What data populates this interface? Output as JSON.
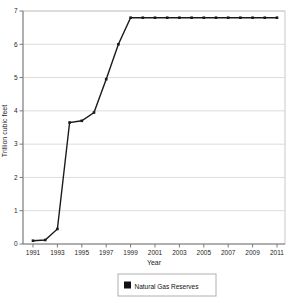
{
  "figure": {
    "background": "#ffffff"
  },
  "chart_data": {
    "type": "line",
    "title": "",
    "xlabel": "Year",
    "ylabel": "Trillion cubic feet",
    "x": [
      1991,
      1992,
      1993,
      1994,
      1995,
      1996,
      1997,
      1998,
      1999,
      2000,
      2001,
      2002,
      2003,
      2004,
      2005,
      2006,
      2007,
      2008,
      2009,
      2010,
      2011
    ],
    "series": [
      {
        "name": "Natural Gas Reserves",
        "values": [
          0.1,
          0.12,
          0.45,
          3.65,
          3.7,
          3.95,
          4.95,
          6.0,
          6.8,
          6.8,
          6.8,
          6.8,
          6.8,
          6.8,
          6.8,
          6.8,
          6.8,
          6.8,
          6.8,
          6.8,
          6.8
        ],
        "color": "#1a1a1a",
        "marker": "square"
      }
    ],
    "ylim": [
      0,
      7
    ],
    "yticks": [
      0,
      1,
      2,
      3,
      4,
      5,
      6,
      7
    ],
    "xticks": [
      1991,
      1993,
      1995,
      1997,
      1999,
      2001,
      2003,
      2005,
      2007,
      2009,
      2011
    ],
    "grid": "horizontal",
    "gridline_color": "#dcdcdc",
    "axis_color": "#7a7a7a",
    "plot_border_color": "#c9c9c9",
    "tick_label_color": "#262626",
    "legend": {
      "position": "bottom",
      "border_color": "#b0b0b0",
      "entries": [
        {
          "label": "Natural Gas Reserves",
          "swatch_color": "#111111"
        }
      ]
    }
  }
}
